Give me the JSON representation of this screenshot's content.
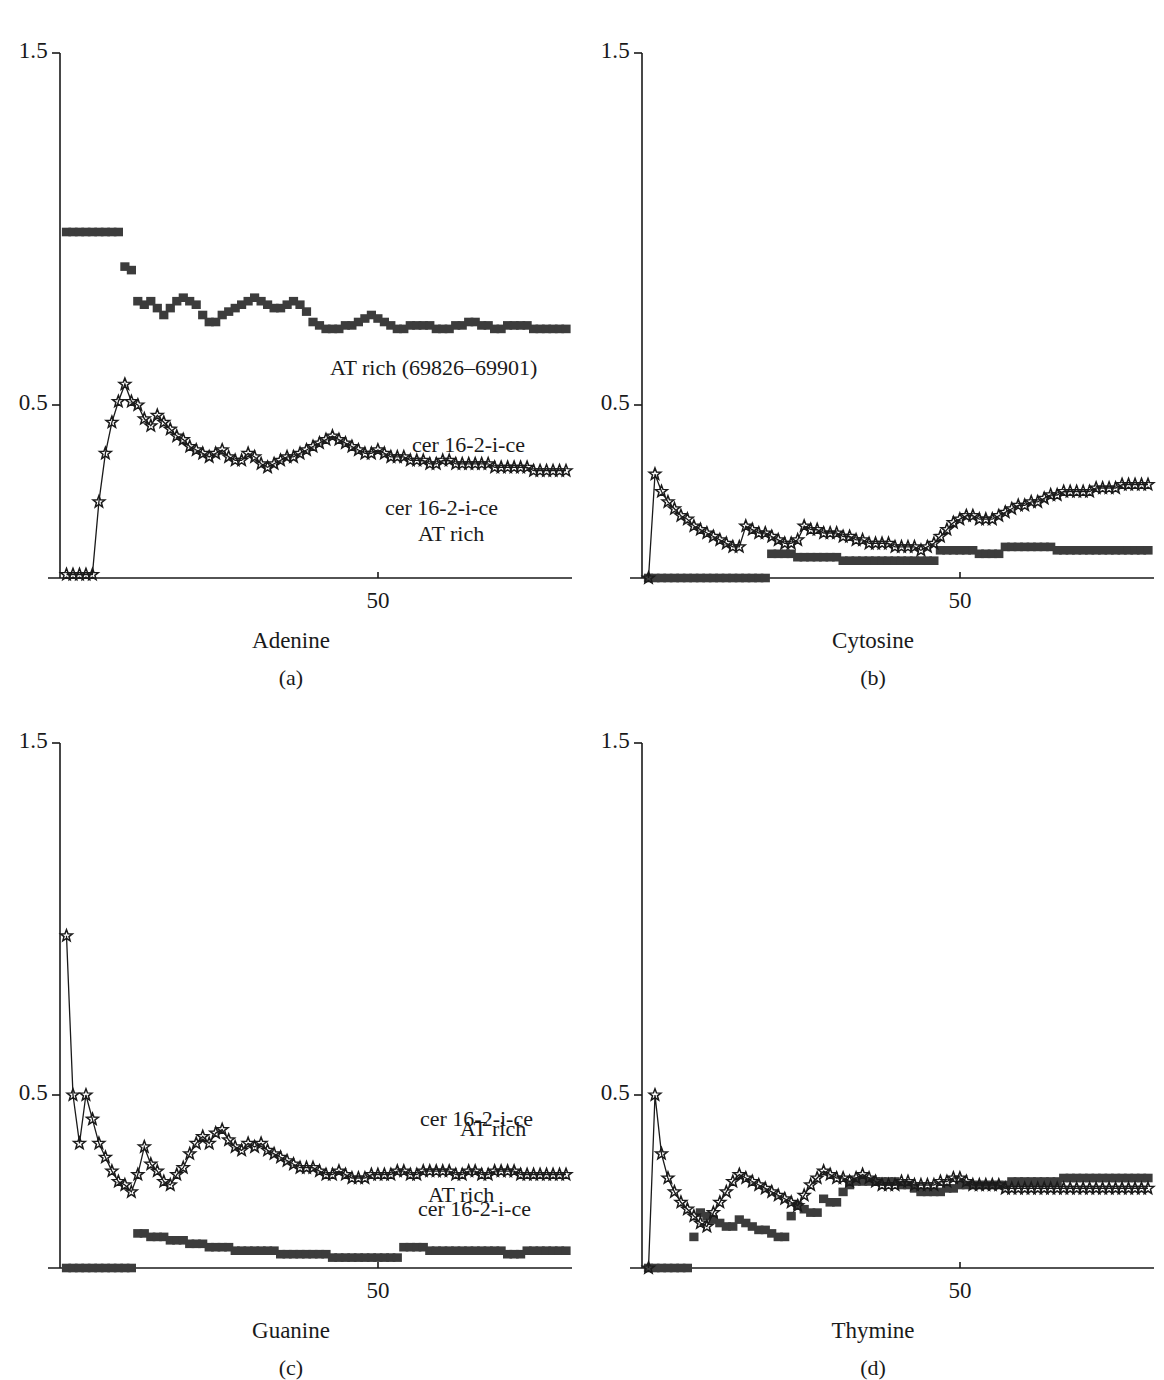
{
  "figure": {
    "kind": "four-panel-line-chart",
    "background": "#ffffff",
    "ink": "#1a1a1a",
    "marker_fill": "#3c3c3c"
  },
  "axes": {
    "y_ticks": [
      "1.5",
      "0.5"
    ],
    "y_tick_values": [
      1.5,
      0.5
    ],
    "x_ticks": [
      "50"
    ],
    "x_tick_values": [
      50
    ],
    "ylim": [
      0,
      1.6
    ],
    "xlim": [
      0,
      78
    ],
    "grid": false
  },
  "panels": [
    {
      "id": "a",
      "caption": "(a)",
      "axis_title": "Adenine",
      "labels": {
        "squares": "AT rich (69826–69901)",
        "stars": "cer 16-2-i-ce"
      },
      "label_pos": {
        "squares": [
          330,
          355
        ],
        "stars": [
          385,
          495
        ]
      }
    },
    {
      "id": "b",
      "caption": "(b)",
      "axis_title": "Cytosine",
      "labels": {
        "squares": "AT rich",
        "stars": "cer 16-2-i-ce"
      },
      "label_pos": {
        "squares": [
          418,
          521
        ],
        "stars": [
          412,
          432
        ]
      }
    },
    {
      "id": "c",
      "caption": "(c)",
      "axis_title": "Guanine",
      "labels": {
        "squares": "AT rich",
        "stars": "cer 16-2-i-ce"
      },
      "label_pos": {
        "squares": [
          428,
          1182
        ],
        "stars": [
          420,
          1106
        ]
      }
    },
    {
      "id": "d",
      "caption": "(d)",
      "axis_title": "Thymine",
      "labels": {
        "squares": "AT rich",
        "stars": "cer 16-2-i-ce"
      },
      "label_pos": {
        "squares": [
          460,
          1116
        ],
        "stars": [
          418,
          1196
        ]
      }
    }
  ],
  "chart_data": [
    {
      "type": "line",
      "panel": "a",
      "title": "Adenine",
      "xlabel": "Adenine",
      "ylabel": "",
      "ylim": [
        0,
        1.6
      ],
      "xlim": [
        0,
        78
      ],
      "legend": [
        "AT rich (69826–69901)",
        "cer 16-2-i-ce"
      ],
      "legend_position": "inline-annotation",
      "x": [
        1,
        2,
        3,
        4,
        5,
        6,
        7,
        8,
        9,
        10,
        11,
        12,
        13,
        14,
        15,
        16,
        17,
        18,
        19,
        20,
        21,
        22,
        23,
        24,
        25,
        26,
        27,
        28,
        29,
        30,
        31,
        32,
        33,
        34,
        35,
        36,
        37,
        38,
        39,
        40,
        41,
        42,
        43,
        44,
        45,
        46,
        47,
        48,
        49,
        50,
        51,
        52,
        53,
        54,
        55,
        56,
        57,
        58,
        59,
        60,
        61,
        62,
        63,
        64,
        65,
        66,
        67,
        68,
        69,
        70,
        71,
        72,
        73,
        74,
        75,
        76,
        77,
        78
      ],
      "series": [
        {
          "name": "AT rich (69826–69901)",
          "marker": "square",
          "values": [
            1.0,
            1.0,
            1.0,
            1.0,
            1.0,
            1.0,
            1.0,
            1.0,
            1.0,
            0.9,
            0.89,
            0.8,
            0.79,
            0.8,
            0.78,
            0.76,
            0.78,
            0.8,
            0.81,
            0.8,
            0.79,
            0.76,
            0.74,
            0.74,
            0.76,
            0.77,
            0.78,
            0.79,
            0.8,
            0.81,
            0.8,
            0.79,
            0.78,
            0.78,
            0.79,
            0.8,
            0.79,
            0.77,
            0.74,
            0.73,
            0.72,
            0.72,
            0.72,
            0.73,
            0.73,
            0.74,
            0.75,
            0.76,
            0.75,
            0.74,
            0.73,
            0.72,
            0.72,
            0.73,
            0.73,
            0.73,
            0.73,
            0.72,
            0.72,
            0.72,
            0.73,
            0.73,
            0.74,
            0.74,
            0.73,
            0.73,
            0.72,
            0.72,
            0.73,
            0.73,
            0.73,
            0.73,
            0.72,
            0.72,
            0.72,
            0.72,
            0.72,
            0.72
          ]
        },
        {
          "name": "cer 16-2-i-ce",
          "marker": "star",
          "values": [
            0.01,
            0.01,
            0.01,
            0.01,
            0.01,
            0.22,
            0.36,
            0.45,
            0.51,
            0.56,
            0.51,
            0.5,
            0.46,
            0.44,
            0.47,
            0.45,
            0.43,
            0.41,
            0.4,
            0.38,
            0.37,
            0.36,
            0.35,
            0.36,
            0.37,
            0.35,
            0.34,
            0.34,
            0.36,
            0.35,
            0.33,
            0.32,
            0.33,
            0.34,
            0.35,
            0.35,
            0.36,
            0.37,
            0.38,
            0.39,
            0.4,
            0.41,
            0.4,
            0.39,
            0.38,
            0.37,
            0.36,
            0.36,
            0.37,
            0.36,
            0.35,
            0.35,
            0.35,
            0.34,
            0.34,
            0.34,
            0.33,
            0.33,
            0.34,
            0.34,
            0.33,
            0.33,
            0.33,
            0.33,
            0.33,
            0.33,
            0.32,
            0.32,
            0.32,
            0.32,
            0.32,
            0.32,
            0.31,
            0.31,
            0.31,
            0.31,
            0.31,
            0.31
          ]
        }
      ]
    },
    {
      "type": "line",
      "panel": "b",
      "title": "Cytosine",
      "xlabel": "Cytosine",
      "ylabel": "",
      "ylim": [
        0,
        1.6
      ],
      "xlim": [
        0,
        78
      ],
      "legend": [
        "AT rich",
        "cer 16-2-i-ce"
      ],
      "legend_position": "inline-annotation",
      "x": [
        1,
        2,
        3,
        4,
        5,
        6,
        7,
        8,
        9,
        10,
        11,
        12,
        13,
        14,
        15,
        16,
        17,
        18,
        19,
        20,
        21,
        22,
        23,
        24,
        25,
        26,
        27,
        28,
        29,
        30,
        31,
        32,
        33,
        34,
        35,
        36,
        37,
        38,
        39,
        40,
        41,
        42,
        43,
        44,
        45,
        46,
        47,
        48,
        49,
        50,
        51,
        52,
        53,
        54,
        55,
        56,
        57,
        58,
        59,
        60,
        61,
        62,
        63,
        64,
        65,
        66,
        67,
        68,
        69,
        70,
        71,
        72,
        73,
        74,
        75,
        76,
        77,
        78
      ],
      "series": [
        {
          "name": "AT rich",
          "marker": "square",
          "values": [
            0.0,
            0.0,
            0.0,
            0.0,
            0.0,
            0.0,
            0.0,
            0.0,
            0.0,
            0.0,
            0.0,
            0.0,
            0.0,
            0.0,
            0.0,
            0.0,
            0.0,
            0.0,
            0.0,
            0.07,
            0.07,
            0.07,
            0.07,
            0.06,
            0.06,
            0.06,
            0.06,
            0.06,
            0.06,
            0.06,
            0.05,
            0.05,
            0.05,
            0.05,
            0.05,
            0.05,
            0.05,
            0.05,
            0.05,
            0.05,
            0.05,
            0.05,
            0.05,
            0.05,
            0.05,
            0.08,
            0.08,
            0.08,
            0.08,
            0.08,
            0.08,
            0.07,
            0.07,
            0.07,
            0.07,
            0.09,
            0.09,
            0.09,
            0.09,
            0.09,
            0.09,
            0.09,
            0.09,
            0.08,
            0.08,
            0.08,
            0.08,
            0.08,
            0.08,
            0.08,
            0.08,
            0.08,
            0.08,
            0.08,
            0.08,
            0.08,
            0.08,
            0.08
          ]
        },
        {
          "name": "cer 16-2-i-ce",
          "marker": "star",
          "values": [
            0.0,
            0.3,
            0.25,
            0.22,
            0.2,
            0.18,
            0.17,
            0.15,
            0.14,
            0.13,
            0.12,
            0.11,
            0.1,
            0.09,
            0.09,
            0.15,
            0.14,
            0.13,
            0.13,
            0.12,
            0.11,
            0.1,
            0.1,
            0.11,
            0.15,
            0.14,
            0.14,
            0.13,
            0.13,
            0.13,
            0.12,
            0.12,
            0.11,
            0.11,
            0.1,
            0.1,
            0.1,
            0.1,
            0.09,
            0.09,
            0.09,
            0.09,
            0.08,
            0.09,
            0.1,
            0.12,
            0.14,
            0.16,
            0.17,
            0.18,
            0.18,
            0.17,
            0.17,
            0.17,
            0.18,
            0.19,
            0.2,
            0.21,
            0.21,
            0.22,
            0.22,
            0.23,
            0.24,
            0.24,
            0.25,
            0.25,
            0.25,
            0.25,
            0.25,
            0.26,
            0.26,
            0.26,
            0.26,
            0.27,
            0.27,
            0.27,
            0.27,
            0.27
          ]
        }
      ]
    },
    {
      "type": "line",
      "panel": "c",
      "title": "Guanine",
      "xlabel": "Guanine",
      "ylabel": "",
      "ylim": [
        0,
        1.6
      ],
      "xlim": [
        0,
        78
      ],
      "legend": [
        "AT rich",
        "cer 16-2-i-ce"
      ],
      "legend_position": "inline-annotation",
      "x": [
        1,
        2,
        3,
        4,
        5,
        6,
        7,
        8,
        9,
        10,
        11,
        12,
        13,
        14,
        15,
        16,
        17,
        18,
        19,
        20,
        21,
        22,
        23,
        24,
        25,
        26,
        27,
        28,
        29,
        30,
        31,
        32,
        33,
        34,
        35,
        36,
        37,
        38,
        39,
        40,
        41,
        42,
        43,
        44,
        45,
        46,
        47,
        48,
        49,
        50,
        51,
        52,
        53,
        54,
        55,
        56,
        57,
        58,
        59,
        60,
        61,
        62,
        63,
        64,
        65,
        66,
        67,
        68,
        69,
        70,
        71,
        72,
        73,
        74,
        75,
        76,
        77,
        78
      ],
      "series": [
        {
          "name": "AT rich",
          "marker": "square",
          "values": [
            0.0,
            0.0,
            0.0,
            0.0,
            0.0,
            0.0,
            0.0,
            0.0,
            0.0,
            0.0,
            0.0,
            0.1,
            0.1,
            0.09,
            0.09,
            0.09,
            0.08,
            0.08,
            0.08,
            0.07,
            0.07,
            0.07,
            0.06,
            0.06,
            0.06,
            0.06,
            0.05,
            0.05,
            0.05,
            0.05,
            0.05,
            0.05,
            0.05,
            0.04,
            0.04,
            0.04,
            0.04,
            0.04,
            0.04,
            0.04,
            0.04,
            0.03,
            0.03,
            0.03,
            0.03,
            0.03,
            0.03,
            0.03,
            0.03,
            0.03,
            0.03,
            0.03,
            0.06,
            0.06,
            0.06,
            0.06,
            0.05,
            0.05,
            0.05,
            0.05,
            0.05,
            0.05,
            0.05,
            0.05,
            0.05,
            0.05,
            0.05,
            0.05,
            0.04,
            0.04,
            0.04,
            0.05,
            0.05,
            0.05,
            0.05,
            0.05,
            0.05,
            0.05
          ]
        },
        {
          "name": "cer 16-2-i-ce",
          "marker": "star",
          "values": [
            0.96,
            0.5,
            0.36,
            0.5,
            0.43,
            0.36,
            0.32,
            0.28,
            0.25,
            0.24,
            0.22,
            0.27,
            0.35,
            0.3,
            0.28,
            0.25,
            0.24,
            0.27,
            0.29,
            0.33,
            0.36,
            0.38,
            0.36,
            0.39,
            0.4,
            0.37,
            0.35,
            0.34,
            0.36,
            0.35,
            0.36,
            0.34,
            0.33,
            0.32,
            0.31,
            0.3,
            0.29,
            0.29,
            0.29,
            0.28,
            0.27,
            0.27,
            0.28,
            0.27,
            0.26,
            0.26,
            0.26,
            0.27,
            0.27,
            0.27,
            0.27,
            0.28,
            0.28,
            0.27,
            0.27,
            0.28,
            0.28,
            0.28,
            0.28,
            0.28,
            0.27,
            0.27,
            0.28,
            0.28,
            0.27,
            0.27,
            0.28,
            0.28,
            0.28,
            0.28,
            0.27,
            0.27,
            0.27,
            0.27,
            0.27,
            0.27,
            0.27,
            0.27
          ]
        }
      ]
    },
    {
      "type": "line",
      "panel": "d",
      "title": "Thymine",
      "xlabel": "Thymine",
      "ylabel": "",
      "ylim": [
        0,
        1.6
      ],
      "xlim": [
        0,
        78
      ],
      "legend": [
        "AT rich",
        "cer 16-2-i-ce"
      ],
      "legend_position": "inline-annotation",
      "x": [
        1,
        2,
        3,
        4,
        5,
        6,
        7,
        8,
        9,
        10,
        11,
        12,
        13,
        14,
        15,
        16,
        17,
        18,
        19,
        20,
        21,
        22,
        23,
        24,
        25,
        26,
        27,
        28,
        29,
        30,
        31,
        32,
        33,
        34,
        35,
        36,
        37,
        38,
        39,
        40,
        41,
        42,
        43,
        44,
        45,
        46,
        47,
        48,
        49,
        50,
        51,
        52,
        53,
        54,
        55,
        56,
        57,
        58,
        59,
        60,
        61,
        62,
        63,
        64,
        65,
        66,
        67,
        68,
        69,
        70,
        71,
        72,
        73,
        74,
        75,
        76,
        77,
        78
      ],
      "series": [
        {
          "name": "AT rich",
          "marker": "square",
          "values": [
            0.0,
            0.0,
            0.0,
            0.0,
            0.0,
            0.0,
            0.0,
            0.09,
            0.16,
            0.15,
            0.14,
            0.13,
            0.12,
            0.12,
            0.14,
            0.13,
            0.12,
            0.11,
            0.11,
            0.1,
            0.09,
            0.09,
            0.15,
            0.18,
            0.17,
            0.16,
            0.16,
            0.2,
            0.19,
            0.19,
            0.22,
            0.24,
            0.25,
            0.25,
            0.25,
            0.25,
            0.25,
            0.25,
            0.25,
            0.24,
            0.24,
            0.23,
            0.22,
            0.22,
            0.22,
            0.22,
            0.23,
            0.23,
            0.24,
            0.24,
            0.24,
            0.24,
            0.24,
            0.24,
            0.24,
            0.24,
            0.25,
            0.25,
            0.25,
            0.25,
            0.25,
            0.25,
            0.25,
            0.25,
            0.26,
            0.26,
            0.26,
            0.26,
            0.26,
            0.26,
            0.26,
            0.26,
            0.26,
            0.26,
            0.26,
            0.26,
            0.26,
            0.26
          ]
        },
        {
          "name": "cer 16-2-i-ce",
          "marker": "star",
          "values": [
            0.0,
            0.5,
            0.33,
            0.26,
            0.22,
            0.19,
            0.17,
            0.15,
            0.13,
            0.12,
            0.16,
            0.19,
            0.22,
            0.25,
            0.27,
            0.26,
            0.25,
            0.24,
            0.23,
            0.22,
            0.21,
            0.2,
            0.19,
            0.18,
            0.21,
            0.24,
            0.26,
            0.28,
            0.27,
            0.26,
            0.26,
            0.25,
            0.26,
            0.27,
            0.26,
            0.25,
            0.24,
            0.24,
            0.24,
            0.25,
            0.25,
            0.24,
            0.24,
            0.24,
            0.24,
            0.25,
            0.25,
            0.26,
            0.26,
            0.25,
            0.24,
            0.24,
            0.24,
            0.24,
            0.24,
            0.23,
            0.23,
            0.23,
            0.23,
            0.23,
            0.23,
            0.23,
            0.23,
            0.23,
            0.23,
            0.23,
            0.23,
            0.23,
            0.23,
            0.23,
            0.23,
            0.23,
            0.23,
            0.23,
            0.23,
            0.23,
            0.23,
            0.23
          ]
        }
      ]
    }
  ]
}
